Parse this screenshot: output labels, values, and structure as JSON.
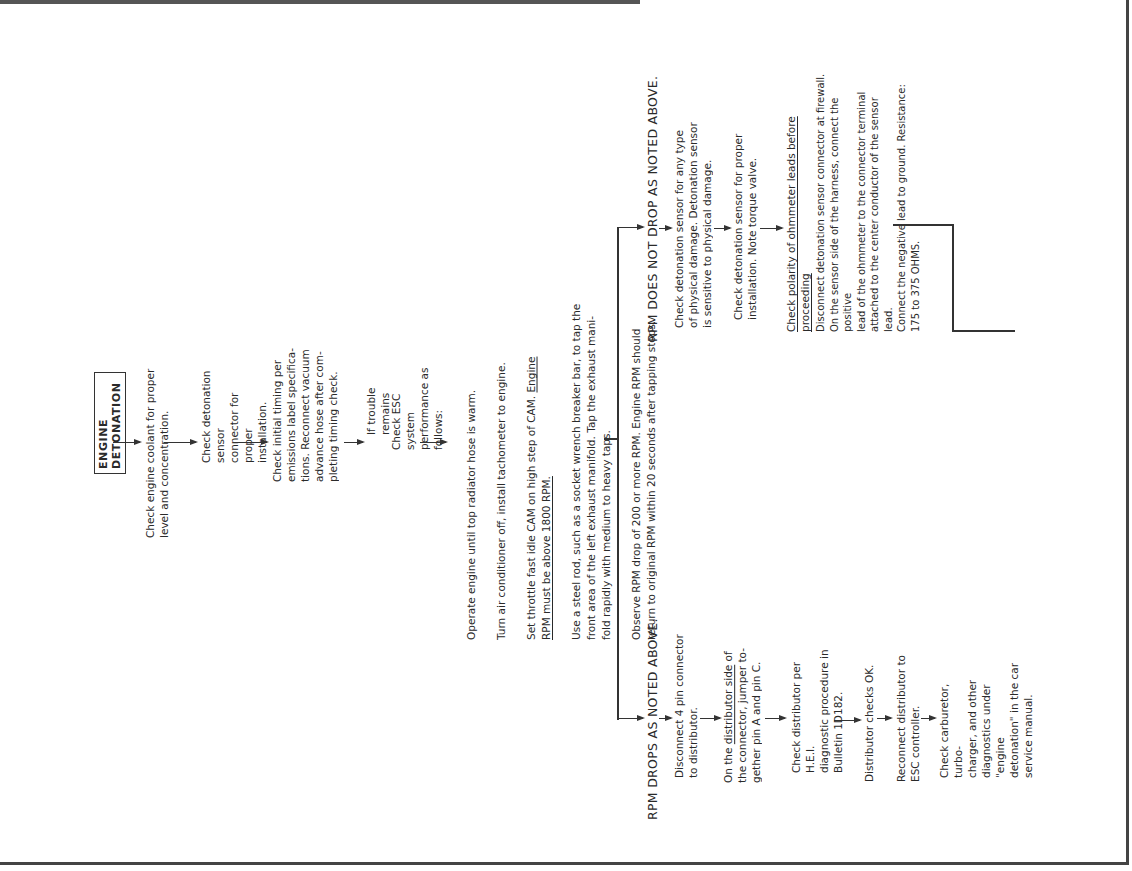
{
  "title": "ENGINE DETONATION",
  "main_flow": [
    {
      "text": "Check engine coolant for proper\nlevel and concentration."
    },
    {
      "text": "Check detonation sensor\nconnector for proper\ninstallation."
    },
    {
      "text": "Check initial timing per\nemissions label specifica-\ntions.  Reconnect vacuum\nadvance hose after com-\npleting timing check."
    },
    {
      "text": "If trouble remains"
    },
    {
      "text": "Check ESC system\nperformance as\nfollows:"
    }
  ],
  "procedure": {
    "line1": "Operate engine until top radiator hose is warm.",
    "line2": "Turn air conditioner off, install tachometer to engine.",
    "line3a": "Set throttle fast idle CAM on high step of CAM.  ",
    "line3b_underlined": "Engine",
    "line3c_underlined": "RPM must be above 1800 RPM.",
    "line4": "Use a steel rod, such as a socket wrench breaker bar, to tap the\nfront area of the left exhaust manifold.  Tap the exhaust mani-\nfold rapidly with medium to heavy taps.",
    "line5": "Observe RPM drop of 200 or more RPM.  Engine RPM should\nreturn to original RPM within 20 seconds after tapping stops."
  },
  "branch_drops": {
    "heading": "RPM DROPS AS NOTED ABOVE.",
    "steps": [
      {
        "text": "Disconnect 4 pin connector\nto distributor."
      },
      {
        "pre": "On the ",
        "underlined": "distributor side",
        "post": " of\nthe connector, jumper to-\ngether pin A and pin C."
      },
      {
        "text": "Check distributor per H.E.I.\ndiagnostic procedure in\nBulletin 1D182."
      },
      {
        "text": "Distributor checks OK."
      },
      {
        "text": "Reconnect distributor to\nESC controller."
      },
      {
        "text": "Check carburetor, turbo-\ncharger, and other\ndiagnostics under \"engine\ndetonation\" in the car\nservice manual."
      }
    ]
  },
  "branch_not_drop": {
    "heading": "RPM DOES NOT DROP AS NOTED ABOVE.",
    "steps": [
      {
        "text": "Check detonation sensor for any type\nof physical damage.  Detonation sensor\nis sensitive to physical damage."
      },
      {
        "text": "Check detonation sensor for proper\ninstallation.  Note torque valve."
      },
      {
        "text": "Check polarity of ohmmeter leads before proceeding",
        "underlined": true
      },
      {
        "text": "Disconnect detonation sensor connector at firewall.\nOn the sensor side of the harness, connect the positive\nlead of the ohmmeter to the connector terminal\nattached to the center conductor of the sensor lead.\nConnect the negative lead to ground.  Resistance:\n175 to 375 OHMS."
      }
    ]
  }
}
